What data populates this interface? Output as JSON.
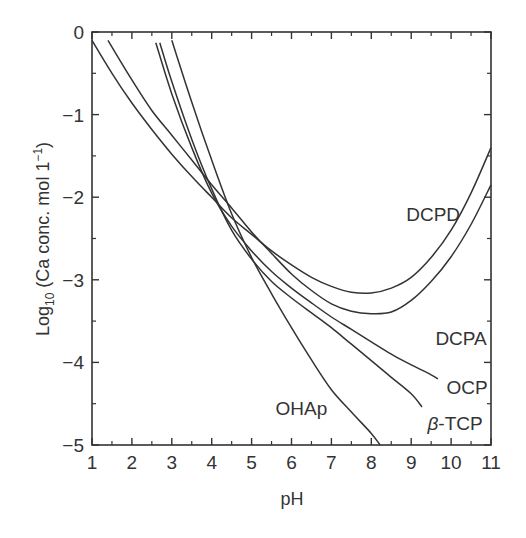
{
  "chart_data": {
    "type": "line",
    "title": "",
    "xlabel": "pH",
    "ylabel": "Log10 (Ca conc. mol 1^-1)",
    "ylabel_parts": {
      "main": "Log",
      "sub": "10",
      "rest": " (Ca conc. mol 1",
      "sup": "−1",
      "end": ")"
    },
    "xlim": [
      1,
      11
    ],
    "ylim": [
      -5,
      0
    ],
    "x_ticks": [
      1,
      2,
      3,
      4,
      5,
      6,
      7,
      8,
      9,
      10,
      11
    ],
    "y_ticks": [
      0,
      -1,
      -2,
      -3,
      -4,
      -5
    ],
    "y_tick_labels": [
      "0",
      "−1",
      "−2",
      "−3",
      "−4",
      "−5"
    ],
    "x_minor_ticks": [
      1.5,
      2.5,
      3.5,
      4.5,
      5.5,
      6.5,
      7.5,
      8.5,
      9.5,
      10.5
    ],
    "y_minor_ticks": [
      -0.5,
      -1.5,
      -2.5,
      -3.5,
      -4.5
    ],
    "grid": false,
    "legend": "none (curves labelled inline)",
    "series": [
      {
        "name": "DCPD",
        "label_pos": [
          9.55,
          -2.2
        ],
        "points": [
          [
            1.0,
            -0.1
          ],
          [
            1.5,
            -0.5
          ],
          [
            2.0,
            -0.86
          ],
          [
            2.5,
            -1.18
          ],
          [
            3.0,
            -1.48
          ],
          [
            3.5,
            -1.75
          ],
          [
            4.0,
            -2.0
          ],
          [
            4.5,
            -2.25
          ],
          [
            5.0,
            -2.45
          ],
          [
            5.5,
            -2.65
          ],
          [
            6.0,
            -2.82
          ],
          [
            6.5,
            -2.97
          ],
          [
            7.0,
            -3.08
          ],
          [
            7.5,
            -3.15
          ],
          [
            8.0,
            -3.16
          ],
          [
            8.5,
            -3.1
          ],
          [
            9.0,
            -2.97
          ],
          [
            9.5,
            -2.73
          ],
          [
            10.0,
            -2.4
          ],
          [
            10.5,
            -1.95
          ],
          [
            11.0,
            -1.4
          ]
        ]
      },
      {
        "name": "DCPA",
        "label_pos": [
          10.25,
          -3.7
        ],
        "points": [
          [
            1.4,
            -0.1
          ],
          [
            2.0,
            -0.58
          ],
          [
            2.5,
            -0.95
          ],
          [
            3.0,
            -1.25
          ],
          [
            3.5,
            -1.55
          ],
          [
            4.0,
            -1.85
          ],
          [
            4.5,
            -2.13
          ],
          [
            5.0,
            -2.42
          ],
          [
            5.5,
            -2.68
          ],
          [
            6.0,
            -2.93
          ],
          [
            6.5,
            -3.13
          ],
          [
            7.0,
            -3.29
          ],
          [
            7.5,
            -3.38
          ],
          [
            8.0,
            -3.41
          ],
          [
            8.5,
            -3.39
          ],
          [
            9.0,
            -3.25
          ],
          [
            9.5,
            -3.02
          ],
          [
            10.0,
            -2.72
          ],
          [
            10.5,
            -2.33
          ],
          [
            11.0,
            -1.85
          ]
        ]
      },
      {
        "name": "OCP",
        "label_pos": [
          10.4,
          -4.3
        ],
        "points": [
          [
            2.6,
            -0.13
          ],
          [
            3.0,
            -0.75
          ],
          [
            3.5,
            -1.4
          ],
          [
            4.0,
            -1.95
          ],
          [
            4.5,
            -2.35
          ],
          [
            5.0,
            -2.65
          ],
          [
            5.5,
            -2.9
          ],
          [
            6.0,
            -3.1
          ],
          [
            6.5,
            -3.28
          ],
          [
            7.0,
            -3.45
          ],
          [
            7.5,
            -3.6
          ],
          [
            8.0,
            -3.75
          ],
          [
            8.5,
            -3.9
          ],
          [
            9.0,
            -4.03
          ],
          [
            9.5,
            -4.15
          ],
          [
            9.67,
            -4.2
          ]
        ]
      },
      {
        "name": "β-TCP",
        "label_pos": [
          10.1,
          -4.73
        ],
        "points": [
          [
            2.7,
            -0.13
          ],
          [
            3.0,
            -0.6
          ],
          [
            3.5,
            -1.3
          ],
          [
            4.0,
            -1.9
          ],
          [
            4.5,
            -2.4
          ],
          [
            5.0,
            -2.75
          ],
          [
            5.5,
            -3.02
          ],
          [
            6.0,
            -3.22
          ],
          [
            6.5,
            -3.4
          ],
          [
            7.0,
            -3.58
          ],
          [
            7.5,
            -3.78
          ],
          [
            8.0,
            -3.98
          ],
          [
            8.5,
            -4.18
          ],
          [
            9.0,
            -4.38
          ],
          [
            9.27,
            -4.54
          ]
        ]
      },
      {
        "name": "OHAp",
        "label_pos": [
          6.25,
          -4.55
        ],
        "points": [
          [
            3.0,
            -0.1
          ],
          [
            3.5,
            -0.85
          ],
          [
            4.0,
            -1.55
          ],
          [
            4.5,
            -2.2
          ],
          [
            5.0,
            -2.73
          ],
          [
            5.5,
            -3.17
          ],
          [
            6.0,
            -3.58
          ],
          [
            6.5,
            -3.97
          ],
          [
            7.0,
            -4.33
          ],
          [
            7.5,
            -4.6
          ],
          [
            8.0,
            -4.86
          ],
          [
            8.22,
            -5.0
          ]
        ]
      }
    ]
  },
  "colors": {
    "line": "#333333",
    "axis": "#333333",
    "background": "#ffffff"
  }
}
